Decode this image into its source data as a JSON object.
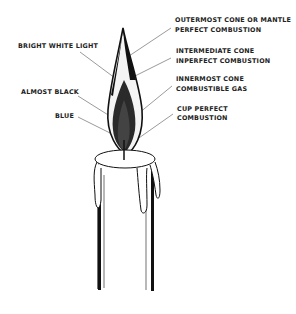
{
  "diagram": {
    "left_labels": [
      {
        "text": "BRIGHT WHITE LIGHT"
      },
      {
        "text": "ALMOST BLACK"
      },
      {
        "text": "BLUE"
      }
    ],
    "right_labels": [
      {
        "line1": "OUTERMOST CONE OR MANTLE",
        "line2": "PERFECT COMBUSTION"
      },
      {
        "line1": "INTERMEDIATE CONE",
        "line2": "INPERFECT COMBUSTION"
      },
      {
        "line1": "INNERMOST CONE",
        "line2": "COMBUSTIBLE GAS"
      },
      {
        "line1": "CUP PERFECT",
        "line2": "COMBUSTION"
      }
    ],
    "colors": {
      "ink": "#1a1a1a",
      "background": "#ffffff"
    }
  }
}
